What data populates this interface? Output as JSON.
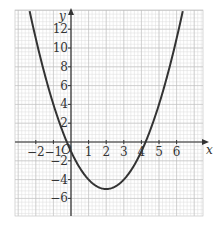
{
  "chart_data": {
    "type": "line",
    "title": "",
    "xlabel": "x",
    "ylabel": "y",
    "origin_label": "O",
    "function": "y = x^2 - 4x - 1",
    "xlim": [
      -3.2,
      7.4
    ],
    "ylim": [
      -7.8,
      14
    ],
    "x_ticks": [
      -2,
      -1,
      1,
      2,
      3,
      4,
      5,
      6
    ],
    "x_tick_labels": [
      "−2",
      "−1",
      "1",
      "2",
      "3",
      "4",
      "5",
      "6"
    ],
    "y_ticks": [
      12,
      10,
      8,
      6,
      4,
      2,
      -2,
      -4,
      -6
    ],
    "y_tick_labels": [
      "12",
      "10",
      "8",
      "6",
      "4",
      "2",
      "−2",
      "−4",
      "−6"
    ],
    "grid": true,
    "series": [
      {
        "name": "parabola",
        "x": [
          -2.3,
          -2,
          -1,
          0,
          1,
          2,
          3,
          4,
          5,
          6,
          6.3
        ],
        "values": [
          13.49,
          11,
          4,
          -1,
          -4,
          -5,
          -4,
          -1,
          4,
          11,
          13.49
        ]
      }
    ],
    "vertex": [
      2,
      -5
    ],
    "roots": [
      -0.24,
      4.24
    ],
    "colors": {
      "curve": "#333333",
      "grid_minor": "#dcdcdc",
      "grid_major": "#bdbdbd",
      "axis": "#333333"
    }
  }
}
